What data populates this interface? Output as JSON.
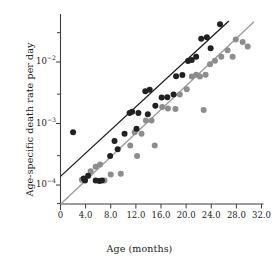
{
  "chart_data": {
    "type": "scatter",
    "title": "",
    "xlabel": "Age (months)",
    "ylabel": "Age-specific death rate per day",
    "xlim": [
      0,
      32.0
    ],
    "ylim": [
      3.5e-05,
      0.055
    ],
    "yscale": "log",
    "xscale": "linear",
    "grid": false,
    "legend": "none",
    "xticks": [
      0,
      4.0,
      8.0,
      12.0,
      16.0,
      20.0,
      24.0,
      28.0,
      32.0
    ],
    "xtick_labels": [
      "0",
      "4.0",
      "8.0",
      "12.0",
      "16.0",
      "20.0",
      "24.0",
      "28.0",
      "32.0"
    ],
    "yticks": [
      0.01,
      0.001,
      0.0001
    ],
    "ytick_labels": [
      "10-2",
      "10-3",
      "10-4"
    ],
    "ytick_mantissa": "10",
    "ytick_exponents": [
      "−2",
      "−3",
      "−4"
    ],
    "yminor_ticks": [
      0.03,
      0.003,
      0.0003,
      5e-05
    ],
    "colors": {
      "series_dark": "#212121",
      "series_light": "#8d8d8d",
      "line_dark": "#1b1b1b",
      "line_light": "#9a9a9a",
      "axis": "#3d3d3d",
      "background": "#ffffff"
    },
    "series": [
      {
        "name": "dark-cohort",
        "marker": "filled-circle",
        "color": "#212121",
        "radius": 3.0,
        "points": [
          [
            2.0,
            0.00072
          ],
          [
            3.7,
            0.000128
          ],
          [
            3.9,
            0.000118
          ],
          [
            4.4,
            0.000142
          ],
          [
            5.6,
            0.000118
          ],
          [
            6.2,
            0.000116
          ],
          [
            6.6,
            0.000118
          ],
          [
            7.9,
            0.000295
          ],
          [
            8.6,
            0.00052
          ],
          [
            9.1,
            0.00038
          ],
          [
            10.2,
            0.00068
          ],
          [
            11.0,
            0.00148
          ],
          [
            11.4,
            0.00155
          ],
          [
            12.1,
            0.00082
          ],
          [
            12.4,
            0.00148
          ],
          [
            13.5,
            0.00335
          ],
          [
            13.9,
            0.00142
          ],
          [
            14.2,
            0.00355
          ],
          [
            15.1,
            0.00195
          ],
          [
            16.1,
            0.00265
          ],
          [
            17.0,
            0.00268
          ],
          [
            18.0,
            0.00295
          ],
          [
            18.4,
            0.00585
          ],
          [
            19.4,
            0.00615
          ],
          [
            20.3,
            0.0104
          ],
          [
            20.9,
            0.0108
          ],
          [
            21.6,
            0.0122
          ],
          [
            22.4,
            0.0238
          ],
          [
            23.3,
            0.0252
          ],
          [
            23.9,
            0.0168
          ],
          [
            25.4,
            0.0412
          ]
        ]
      },
      {
        "name": "light-cohort",
        "marker": "filled-circle",
        "color": "#8d8d8d",
        "radius": 3.0,
        "points": [
          [
            3.4,
            0.000122
          ],
          [
            4.8,
            0.000168
          ],
          [
            5.6,
            0.000198
          ],
          [
            6.3,
            0.000215
          ],
          [
            7.0,
            0.000118
          ],
          [
            8.0,
            0.000148
          ],
          [
            9.6,
            0.000152
          ],
          [
            11.1,
            0.00044
          ],
          [
            11.8,
            0.00072
          ],
          [
            12.2,
            0.000295
          ],
          [
            12.9,
            0.00068
          ],
          [
            13.6,
            0.00112
          ],
          [
            14.5,
            0.00112
          ],
          [
            15.0,
            0.00044
          ],
          [
            16.2,
            0.00185
          ],
          [
            17.1,
            0.00175
          ],
          [
            18.3,
            0.00172
          ],
          [
            19.0,
            0.00295
          ],
          [
            20.1,
            0.0036
          ],
          [
            20.9,
            0.0058
          ],
          [
            21.6,
            0.0062
          ],
          [
            22.2,
            0.0058
          ],
          [
            22.8,
            0.00165
          ],
          [
            23.1,
            0.0062
          ],
          [
            23.8,
            0.0092
          ],
          [
            24.6,
            0.0105
          ],
          [
            25.6,
            0.0122
          ],
          [
            26.6,
            0.0155
          ],
          [
            27.4,
            0.0122
          ],
          [
            27.9,
            0.0232
          ],
          [
            29.0,
            0.0212
          ],
          [
            29.8,
            0.0178
          ]
        ]
      }
    ],
    "fit_lines": [
      {
        "name": "dark-fit",
        "color": "#1b1b1b",
        "width": 1.3,
        "x_start": 0.0,
        "y_start": 0.000138,
        "x_end": 26.8,
        "y_end": 0.0465
      },
      {
        "name": "light-fit",
        "color": "#9a9a9a",
        "width": 1.3,
        "x_start": 0.0,
        "y_start": 4.85e-05,
        "x_end": 30.8,
        "y_end": 0.0452
      }
    ]
  }
}
